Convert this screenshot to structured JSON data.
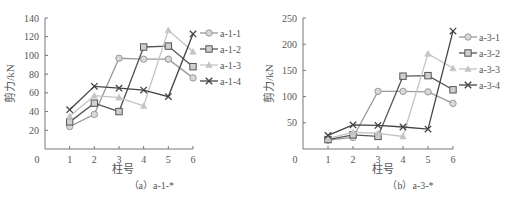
{
  "chart_data": [
    {
      "type": "line",
      "title": "",
      "caption": "（a）a-1-*",
      "xlabel": "柱号",
      "ylabel": "剪力/kN",
      "x": [
        1,
        2,
        3,
        4,
        5,
        6
      ],
      "xticks": [
        "0",
        "1",
        "2",
        "3",
        "4",
        "5",
        "6"
      ],
      "yticks": [
        "20",
        "40",
        "60",
        "80",
        "100",
        "120",
        "140"
      ],
      "origin_label": "0",
      "xlim": [
        0,
        6
      ],
      "ylim": [
        0,
        140
      ],
      "grid": false,
      "legend_position": "right",
      "series": [
        {
          "name": "a-1-1",
          "marker": "circle",
          "color": "#9a9a9a",
          "values": [
            24,
            37,
            97,
            96,
            96,
            76
          ]
        },
        {
          "name": "a-1-2",
          "marker": "square",
          "color": "#555555",
          "values": [
            29,
            49,
            40,
            109,
            110,
            88
          ]
        },
        {
          "name": "a-1-3",
          "marker": "triangle",
          "color": "#c4c4c4",
          "values": [
            35,
            57,
            55,
            46,
            127,
            104
          ]
        },
        {
          "name": "a-1-4",
          "marker": "x",
          "color": "#444444",
          "values": [
            42,
            67,
            65,
            63,
            56,
            123
          ]
        }
      ]
    },
    {
      "type": "line",
      "title": "",
      "caption": "（b）a-3-*",
      "xlabel": "柱号",
      "ylabel": "剪力/kN",
      "x": [
        1,
        2,
        3,
        4,
        5,
        6
      ],
      "xticks": [
        "0",
        "1",
        "2",
        "3",
        "4",
        "5",
        "6"
      ],
      "yticks": [
        "50",
        "100",
        "150",
        "200",
        "250"
      ],
      "origin_label": "0",
      "xlim": [
        0,
        6
      ],
      "ylim": [
        0,
        250
      ],
      "grid": false,
      "legend_position": "right",
      "series": [
        {
          "name": "a-3-1",
          "marker": "circle",
          "color": "#9a9a9a",
          "values": [
            17,
            22,
            110,
            110,
            109,
            87
          ]
        },
        {
          "name": "a-3-2",
          "marker": "square",
          "color": "#555555",
          "values": [
            18,
            27,
            24,
            139,
            140,
            113
          ]
        },
        {
          "name": "a-3-3",
          "marker": "triangle",
          "color": "#c4c4c4",
          "values": [
            20,
            32,
            30,
            24,
            182,
            154
          ]
        },
        {
          "name": "a-3-4",
          "marker": "x",
          "color": "#444444",
          "values": [
            26,
            46,
            45,
            42,
            38,
            225
          ]
        }
      ]
    }
  ]
}
